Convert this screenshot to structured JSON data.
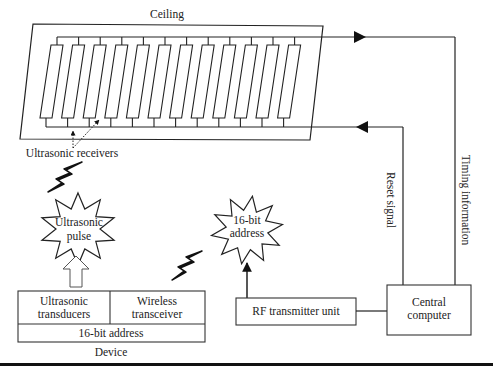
{
  "diagram": {
    "ceiling": {
      "label": "Ceiling",
      "receiver_count": 12
    },
    "receivers_label": "Ultrasonic receivers",
    "ultrasonic_pulse": {
      "line1": "Ultrasonic",
      "line2": "pulse"
    },
    "address_burst": {
      "line1": "16-bit",
      "line2": "address"
    },
    "device": {
      "label": "Device",
      "cells": {
        "transducers_line1": "Ultrasonic",
        "transducers_line2": "transducers",
        "transceiver_line1": "Wireless",
        "transceiver_line2": "transceiver",
        "address": "16-bit address"
      }
    },
    "rf_transmitter": {
      "label": "RF transmitter unit"
    },
    "central_computer": {
      "line1": "Central",
      "line2": "computer"
    },
    "signals": {
      "reset": "Reset signal",
      "timing": "Timing information"
    }
  }
}
